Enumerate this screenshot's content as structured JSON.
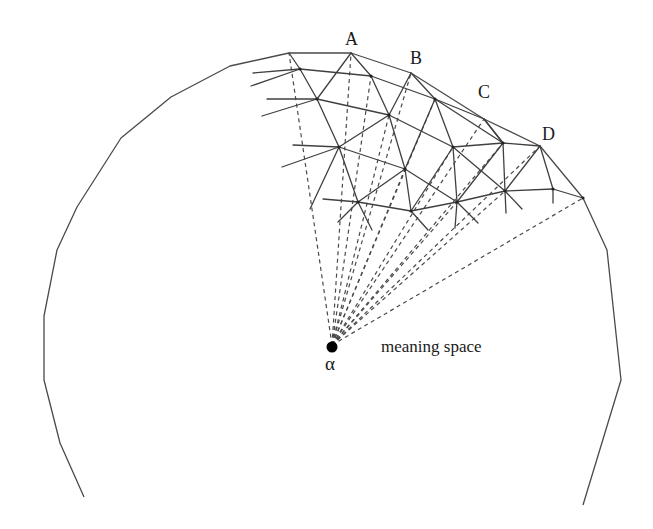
{
  "figure": {
    "type": "diagram",
    "labels": {
      "point_a": "A",
      "point_b": "B",
      "point_c": "C",
      "point_d": "D",
      "origin": "α",
      "region": "meaning space"
    },
    "colors": {
      "line": "#404040",
      "background": "#ffffff",
      "origin_dot": "#000000"
    },
    "origin": {
      "x": 332,
      "y": 347
    },
    "outline_points": [
      [
        84,
        497
      ],
      [
        60,
        443
      ],
      [
        44,
        380
      ],
      [
        44,
        316
      ],
      [
        57,
        250
      ],
      [
        77,
        207
      ],
      [
        121,
        138
      ],
      [
        171,
        97
      ],
      [
        230,
        66
      ],
      [
        289,
        53
      ],
      [
        351,
        53
      ],
      [
        411,
        73
      ],
      [
        484,
        119
      ],
      [
        540,
        146
      ],
      [
        583,
        198
      ],
      [
        607,
        250
      ],
      [
        621,
        380
      ],
      [
        583,
        505
      ]
    ],
    "ray_targets": [
      [
        289,
        53
      ],
      [
        351,
        53
      ],
      [
        371,
        76
      ],
      [
        411,
        73
      ],
      [
        339,
        147
      ],
      [
        389,
        115
      ],
      [
        435,
        99
      ],
      [
        358,
        202
      ],
      [
        405,
        169
      ],
      [
        453,
        147
      ],
      [
        484,
        119
      ],
      [
        411,
        211
      ],
      [
        457,
        202
      ],
      [
        503,
        143
      ],
      [
        505,
        191
      ],
      [
        553,
        189
      ],
      [
        583,
        198
      ]
    ]
  }
}
